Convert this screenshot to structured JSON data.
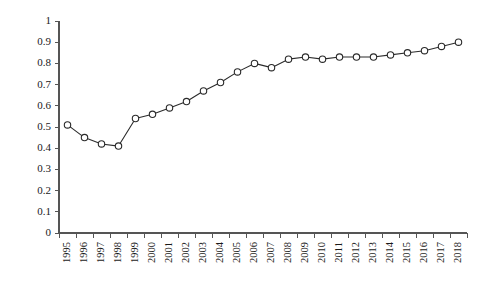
{
  "chart_data": {
    "type": "line",
    "title": "",
    "subtitle": "",
    "xlabel": "",
    "ylabel": "",
    "categories": [
      "1995",
      "1996",
      "1997",
      "1998",
      "1999",
      "2000",
      "2001",
      "2002",
      "2003",
      "2004",
      "2005",
      "2006",
      "2007",
      "2008",
      "2009",
      "2010",
      "2011",
      "2012",
      "2013",
      "2014",
      "2015",
      "2016",
      "2017",
      "2018"
    ],
    "values": [
      0.51,
      0.45,
      0.42,
      0.41,
      0.54,
      0.56,
      0.59,
      0.62,
      0.67,
      0.71,
      0.76,
      0.8,
      0.78,
      0.82,
      0.83,
      0.82,
      0.83,
      0.83,
      0.83,
      0.84,
      0.85,
      0.86,
      0.88,
      0.9
    ],
    "series": [
      {
        "name": "series-1",
        "values": [
          0.51,
          0.45,
          0.42,
          0.41,
          0.54,
          0.56,
          0.59,
          0.62,
          0.67,
          0.71,
          0.76,
          0.8,
          0.78,
          0.82,
          0.83,
          0.82,
          0.83,
          0.83,
          0.83,
          0.84,
          0.85,
          0.86,
          0.88,
          0.9
        ]
      }
    ],
    "ylim": [
      0,
      1
    ],
    "yticks": [
      0,
      0.1,
      0.2,
      0.3,
      0.4,
      0.5,
      0.6,
      0.7,
      0.8,
      0.9,
      1
    ],
    "ytick_labels": [
      "0",
      "0.1",
      "0.2",
      "0.3",
      "0.4",
      "0.5",
      "0.6",
      "0.7",
      "0.8",
      "0.9",
      "1"
    ],
    "xtick_labels": [
      "1995",
      "1996",
      "1997",
      "1998",
      "1999",
      "2000",
      "2001",
      "2002",
      "2003",
      "2004",
      "2005",
      "2006",
      "2007",
      "2008",
      "2009",
      "2010",
      "2011",
      "2012",
      "2013",
      "2014",
      "2015",
      "2016",
      "2017",
      "2018"
    ],
    "grid": false,
    "legend": false,
    "legend_position": "none",
    "marker": "open-circle",
    "line_color": "#2b2b2b",
    "marker_fill": "#ffffff",
    "marker_stroke": "#2b2b2b",
    "axis_color": "#555555",
    "background_color": "#ffffff",
    "xtick_label_rotation": -90
  }
}
